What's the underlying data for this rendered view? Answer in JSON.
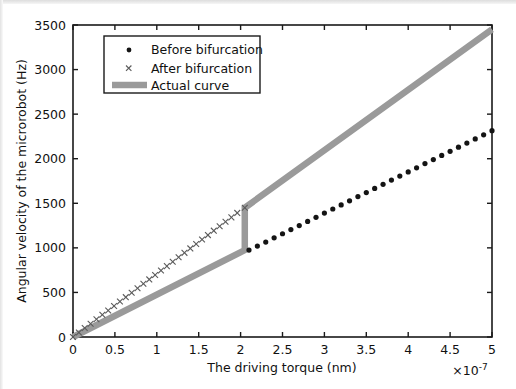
{
  "chart_data": {
    "type": "scatter",
    "title": "",
    "xlabel": "The driving torque (nm)",
    "ylabel": "Angular velocity of the microrobot (Hz)",
    "x_exponent_label": "×10",
    "x_exponent_power": "-7",
    "xlim": [
      0,
      5
    ],
    "ylim": [
      0,
      3500
    ],
    "xticks": [
      0,
      0.5,
      1,
      1.5,
      2,
      2.5,
      3,
      3.5,
      4,
      4.5,
      5
    ],
    "xticklabels": [
      "0",
      "0.5",
      "1",
      "1.5",
      "2",
      "2.5",
      "3",
      "3.5",
      "4",
      "4.5",
      "5"
    ],
    "yticks": [
      0,
      500,
      1000,
      1500,
      2000,
      2500,
      3000,
      3500
    ],
    "yticklabels": [
      "0",
      "500",
      "1000",
      "1500",
      "2000",
      "2500",
      "3000",
      "3500"
    ],
    "grid": false,
    "legend_position": "upper-left-inset",
    "series": [
      {
        "name": "Before bifurcation",
        "marker": "dot",
        "color": "#141414",
        "x": [
          2.1,
          2.2,
          2.3,
          2.4,
          2.5,
          2.6,
          2.7,
          2.8,
          2.9,
          3.0,
          3.1,
          3.2,
          3.3,
          3.4,
          3.5,
          3.6,
          3.7,
          3.8,
          3.9,
          4.0,
          4.1,
          4.2,
          4.3,
          4.4,
          4.5,
          4.6,
          4.7,
          4.8,
          4.9,
          5.0
        ],
        "y": [
          975,
          1020,
          1065,
          1112,
          1158,
          1205,
          1250,
          1297,
          1343,
          1390,
          1436,
          1482,
          1528,
          1575,
          1620,
          1667,
          1713,
          1760,
          1805,
          1852,
          1898,
          1945,
          1990,
          2037,
          2083,
          2130,
          2175,
          2222,
          2268,
          2315
        ]
      },
      {
        "name": "After bifurcation",
        "marker": "x",
        "color": "#5a5a5a",
        "x": [
          0.0,
          0.07,
          0.14,
          0.21,
          0.28,
          0.35,
          0.42,
          0.49,
          0.56,
          0.63,
          0.7,
          0.77,
          0.84,
          0.91,
          0.98,
          1.05,
          1.12,
          1.19,
          1.26,
          1.33,
          1.4,
          1.47,
          1.54,
          1.61,
          1.68,
          1.75,
          1.82,
          1.89,
          1.96,
          2.05
        ],
        "y": [
          0,
          50,
          100,
          149,
          199,
          249,
          298,
          348,
          398,
          447,
          497,
          547,
          597,
          646,
          696,
          746,
          795,
          845,
          895,
          944,
          994,
          1044,
          1094,
          1143,
          1193,
          1243,
          1292,
          1342,
          1392,
          1450
        ]
      },
      {
        "name": "Actual curve",
        "marker": "line",
        "color": "#9a9a9a",
        "x": [
          0.0,
          2.05,
          2.05,
          5.0
        ],
        "y": [
          0,
          975,
          1450,
          3450
        ]
      }
    ],
    "legend": [
      {
        "label": "Before bifurcation",
        "marker": "dot"
      },
      {
        "label": "After bifurcation",
        "marker": "x"
      },
      {
        "label": "Actual curve",
        "marker": "line"
      }
    ]
  }
}
